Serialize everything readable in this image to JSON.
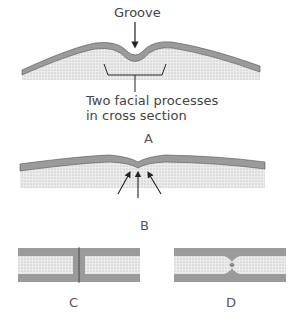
{
  "figure": {
    "panel_a": {
      "groove_label": "Groove",
      "processes_label_line1": "Two facial processes",
      "processes_label_line2": "in cross section",
      "letter": "A"
    },
    "panel_b": {
      "letter": "B"
    },
    "panel_c": {
      "letter": "C"
    },
    "panel_d": {
      "letter": "D"
    }
  },
  "colors": {
    "epithelium": "#9a9a9a",
    "mesenchyme": "#e6e6e6",
    "line": "#333333"
  }
}
